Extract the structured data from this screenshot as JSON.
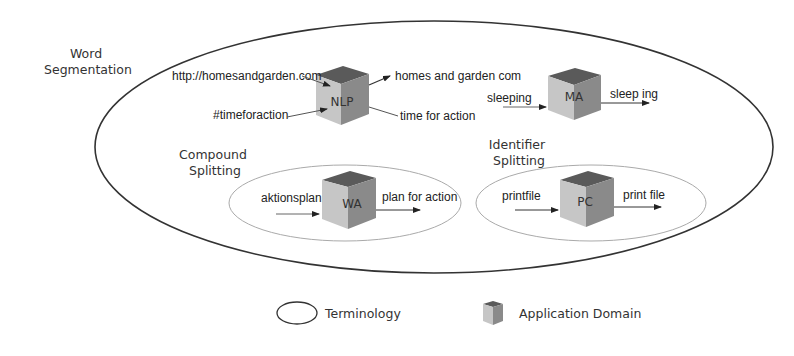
{
  "sections": {
    "word_segmentation": [
      "Word",
      "Segmentation"
    ],
    "compound_splitting": [
      "Compound",
      "Splitting"
    ],
    "identifier_splitting": [
      "Identifier",
      "Splitting"
    ]
  },
  "cubes": {
    "nlp": {
      "label": "NLP",
      "inputs": [
        "http://homesandgarden.com",
        "#timeforaction"
      ],
      "outputs": [
        "homes and garden com",
        "time for action"
      ]
    },
    "ma": {
      "label": "MA",
      "input": "sleeping",
      "output": "sleep ing"
    },
    "wa": {
      "label": "WA",
      "input": "aktionsplan",
      "output": "plan for action"
    },
    "pc": {
      "label": "PC",
      "input": "printfile",
      "output": "print file"
    }
  },
  "legend": {
    "terminology": "Terminology",
    "application_domain": "Application Domain"
  },
  "colors": {
    "cube_top": "#5a5a5a",
    "cube_left": "#c4c4c4",
    "cube_right": "#8a8a8a",
    "ellipse_stroke": "#333333",
    "inner_ellipse_stroke": "#aaaaaa"
  }
}
